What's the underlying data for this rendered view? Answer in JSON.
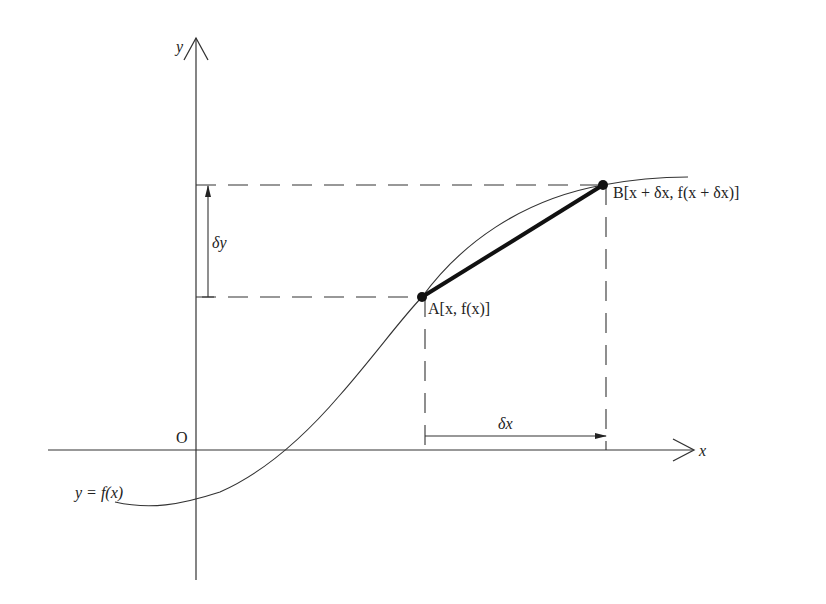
{
  "diagram": {
    "colors": {
      "stroke": "#222222",
      "background": "#ffffff"
    },
    "axes": {
      "x_label": "x",
      "y_label": "y",
      "origin_label": "O"
    },
    "curve": {
      "label": "y = f(x)"
    },
    "points": {
      "A": {
        "name": "A",
        "coords": "[x, f(x)]",
        "label": "A[x, f(x)]"
      },
      "B": {
        "name": "B",
        "coords": "[x + δx, f(x + δx)]",
        "label": "B[x + δx, f(x + δx)]"
      }
    },
    "increments": {
      "dx": "δx",
      "dy": "δy"
    }
  }
}
